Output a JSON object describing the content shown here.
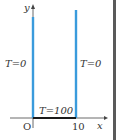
{
  "diagram": {
    "axes": {
      "y_label": "y",
      "x_label": "x",
      "origin_label": "O",
      "x_tick_label": "10"
    },
    "boundaries": {
      "left": {
        "label": "T=0",
        "color": "#3a9bdc"
      },
      "right": {
        "label": "T=0",
        "color": "#3a9bdc"
      },
      "bottom": {
        "label": "T=100",
        "color": "#1a1a1a"
      }
    }
  }
}
